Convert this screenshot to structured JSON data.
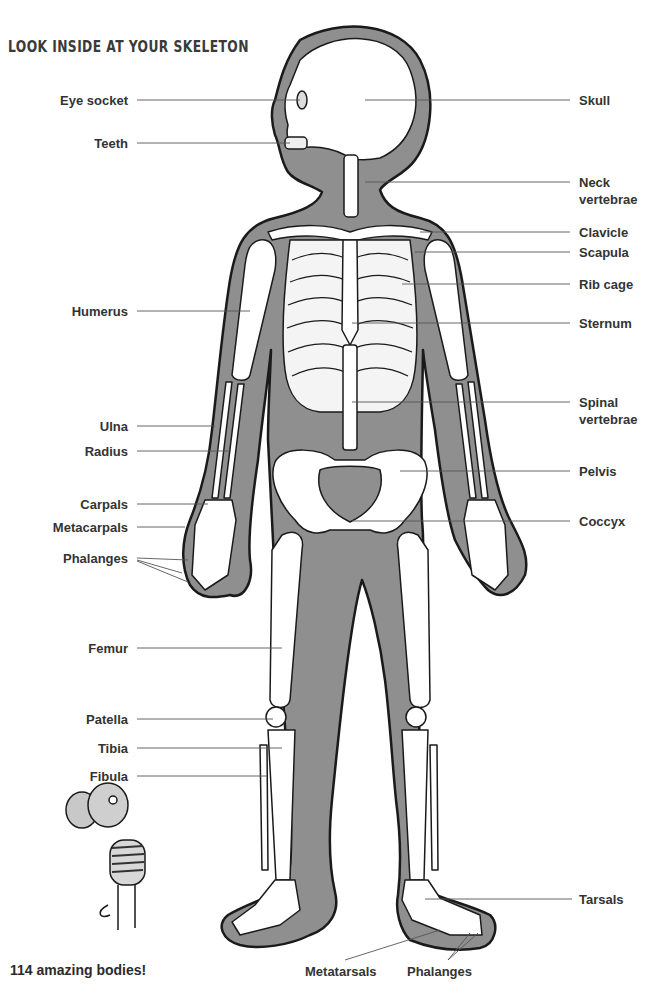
{
  "page": {
    "title": "LOOK INSIDE AT YOUR SKELETON",
    "footer": "114  amazing bodies!"
  },
  "colors": {
    "body_fill": "#8f8f8f",
    "bone_fill": "#ffffff",
    "outline": "#1a1a1a",
    "label_text": "#333333",
    "leader_line": "#555555"
  },
  "labels": {
    "left": [
      {
        "text": "Eye socket",
        "y": 100
      },
      {
        "text": "Teeth",
        "y": 143
      },
      {
        "text": "Humerus",
        "y": 311
      },
      {
        "text": "Ulna",
        "y": 426
      },
      {
        "text": "Radius",
        "y": 451
      },
      {
        "text": "Carpals",
        "y": 504
      },
      {
        "text": "Metacarpals",
        "y": 527
      },
      {
        "text": "Phalanges",
        "y": 558
      },
      {
        "text": "Femur",
        "y": 648
      },
      {
        "text": "Patella",
        "y": 719
      },
      {
        "text": "Tibia",
        "y": 748
      },
      {
        "text": "Fibula",
        "y": 776
      }
    ],
    "right": [
      {
        "text": "Skull",
        "y": 100
      },
      {
        "text": "Neck",
        "text2": "vertebrae",
        "y": 182
      },
      {
        "text": "Clavicle",
        "y": 232
      },
      {
        "text": "Scapula",
        "y": 252
      },
      {
        "text": "Rib cage",
        "y": 284
      },
      {
        "text": "Sternum",
        "y": 323
      },
      {
        "text": "Spinal",
        "text2": "vertebrae",
        "y": 402
      },
      {
        "text": "Pelvis",
        "y": 471
      },
      {
        "text": "Coccyx",
        "y": 521
      },
      {
        "text": "Tarsals",
        "y": 899
      }
    ],
    "bottom": [
      {
        "text": "Metatarsals",
        "x": 305,
        "y": 963
      },
      {
        "text": "Phalanges",
        "x": 407,
        "y": 963
      }
    ]
  }
}
